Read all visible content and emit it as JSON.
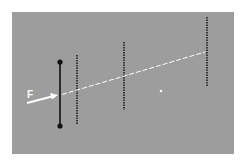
{
  "diagram": {
    "type": "optics-lens-ray-diagram",
    "background_color": "#9d9d9d",
    "labels": {
      "force_or_focus": "F"
    },
    "elements": [
      {
        "kind": "solid-line-with-endpoints",
        "color": "#111111",
        "x": 60,
        "y1": 62,
        "y2": 126
      },
      {
        "kind": "dotted-line",
        "color": "#222222",
        "x": 77,
        "y1": 55,
        "y2": 124
      },
      {
        "kind": "dotted-line",
        "color": "#222222",
        "x": 124,
        "y1": 42,
        "y2": 110
      },
      {
        "kind": "dotted-line",
        "color": "#222222",
        "x": 207,
        "y1": 17,
        "y2": 86
      },
      {
        "kind": "arrow",
        "color": "#ffffff",
        "from": [
          27,
          103
        ],
        "to": [
          58,
          95
        ]
      },
      {
        "kind": "dashed-ray",
        "color": "#ffffff",
        "from": [
          60,
          95
        ],
        "to": [
          205,
          52
        ]
      },
      {
        "kind": "dot",
        "color": "#ffffff",
        "x": 161,
        "y": 91
      }
    ]
  }
}
